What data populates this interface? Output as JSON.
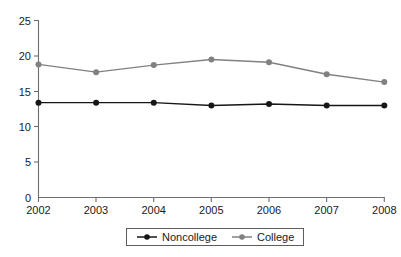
{
  "chart_data": {
    "type": "line",
    "title": "",
    "subtitle": "",
    "xlabel": "",
    "ylabel": "",
    "categories": [
      "2002",
      "2003",
      "2004",
      "2005",
      "2006",
      "2007",
      "2008"
    ],
    "x": [
      2002,
      2003,
      2004,
      2005,
      2006,
      2007,
      2008
    ],
    "series": [
      {
        "name": "Noncollege",
        "color": "#161616",
        "marker": "circle",
        "values": [
          13.4,
          13.4,
          13.4,
          13.0,
          13.2,
          13.0,
          13.0
        ]
      },
      {
        "name": "College",
        "color": "#818181",
        "marker": "circle",
        "values": [
          18.8,
          17.7,
          18.7,
          19.5,
          19.1,
          17.4,
          16.3
        ]
      }
    ],
    "ylim": [
      0,
      25
    ],
    "yticks": [
      0,
      5,
      10,
      15,
      20,
      25
    ],
    "ytick_labels": [
      "0",
      "5",
      "10",
      "15",
      "20",
      "25"
    ],
    "xtick_labels": [
      "2002",
      "2003",
      "2004",
      "2005",
      "2006",
      "2007",
      "2008"
    ],
    "grid": false,
    "legend_position": "bottom-center",
    "legend_entries": [
      "Noncollege",
      "College"
    ]
  },
  "axes": {
    "y_ticks": [
      {
        "label": "25",
        "value": 25
      },
      {
        "label": "20",
        "value": 20
      },
      {
        "label": "15",
        "value": 15
      },
      {
        "label": "10",
        "value": 10
      },
      {
        "label": "5",
        "value": 5
      },
      {
        "label": "0",
        "value": 0
      }
    ],
    "x_ticks": [
      {
        "label": "2002"
      },
      {
        "label": "2003"
      },
      {
        "label": "2004"
      },
      {
        "label": "2005"
      },
      {
        "label": "2006"
      },
      {
        "label": "2007"
      },
      {
        "label": "2008"
      }
    ]
  },
  "legend": {
    "items": [
      {
        "label": "Noncollege",
        "color": "#161616"
      },
      {
        "label": "College",
        "color": "#818181"
      }
    ]
  },
  "colors": {
    "noncollege": "#161616",
    "college": "#818181",
    "axis": "#6e6e6e",
    "background": "#ffffff"
  }
}
